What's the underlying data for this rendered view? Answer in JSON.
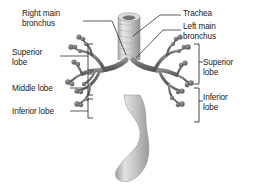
{
  "figure": {
    "background_color": "#ffffff",
    "text_color": "#1a1a1a",
    "leader_line_color": "#333333",
    "bracket_color": "#333333",
    "trachea_color": "#c9c9c9",
    "bronchi_color": "#6a6a6a",
    "esophagus_color": "#bdbdbd"
  },
  "labels": {
    "right_main_bronchus": "Right main\nbronchus",
    "superior_lobe_left": "Superior\nlobe",
    "middle_lobe_left": "Middle lobe",
    "inferior_lobe_left": "Inferior lobe",
    "trachea": "Trachea",
    "left_main_bronchus": "Left main\nbronchus",
    "superior_lobe_right": "Superior\nlobe",
    "inferior_lobe_right": "Inferior\nlobe"
  }
}
